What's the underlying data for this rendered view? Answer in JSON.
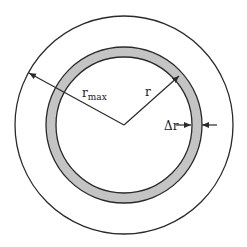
{
  "diagram": {
    "colors": {
      "background": "#ffffff",
      "stroke": "#2a2a2a",
      "ring_fill": "#c4c4c4"
    },
    "geometry": {
      "center": [
        124,
        125
      ],
      "outer_radius": 109,
      "ring_outer_radius": 78,
      "ring_inner_radius": 68
    },
    "labels": {
      "r_max_base": "r",
      "r_max_sub": "max",
      "r": "r",
      "delta_r": "Δr"
    }
  }
}
